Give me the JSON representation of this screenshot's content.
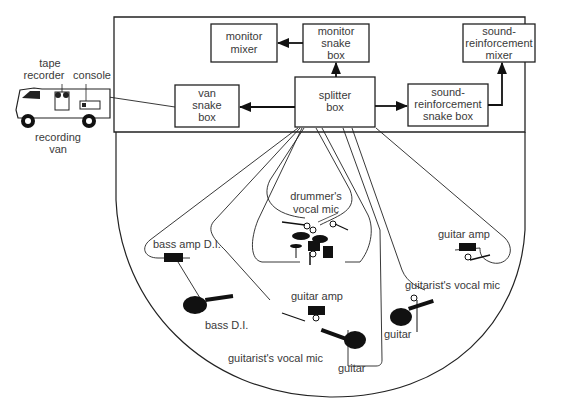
{
  "diagram": {
    "van": {
      "label_line1": "recording",
      "label_line2": "van",
      "tape_recorder_line1": "tape",
      "tape_recorder_line2": "recorder",
      "console": "console"
    },
    "boxes": {
      "monitor_mixer": [
        "monitor",
        "mixer"
      ],
      "monitor_snake_box": [
        "monitor",
        "snake",
        "box"
      ],
      "sr_mixer": [
        "sound-",
        "reinforcement",
        "mixer"
      ],
      "van_snake_box": [
        "van",
        "snake",
        "box"
      ],
      "splitter_box": [
        "splitter",
        "box"
      ],
      "sr_snake_box": [
        "sound-",
        "reinforcement",
        "snake box"
      ]
    },
    "stage_labels": {
      "drummers_vocal_mic_1": "drummer's",
      "drummers_vocal_mic_2": "vocal mic",
      "bass_amp_di": "bass amp D.I.",
      "bass_di": "bass D.I.",
      "guitar_amp_center": "guitar amp",
      "guitarists_vocal_mic_center": "guitarist's vocal mic",
      "guitar_center": "guitar",
      "guitar_amp_right": "guitar amp",
      "guitarists_vocal_mic_right": "guitarist's vocal mic",
      "guitar_right": "guitar"
    },
    "colors": {
      "line": "#222222",
      "text": "#3a3a3a",
      "background": "#ffffff"
    }
  }
}
